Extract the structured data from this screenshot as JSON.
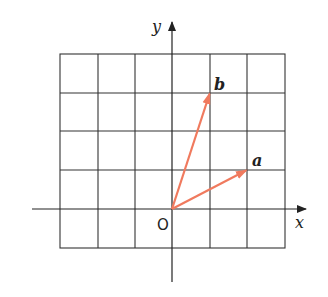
{
  "diagram": {
    "type": "vector-grid",
    "grid": {
      "x_min": -3,
      "x_max": 3,
      "y_min": -1,
      "y_max": 4,
      "cell": 1
    },
    "axes": {
      "x_label": "x",
      "y_label": "y",
      "origin_label": "O"
    },
    "vectors": [
      {
        "name": "a",
        "from": [
          0,
          0
        ],
        "to": [
          2,
          1
        ],
        "color": "#f07a5e"
      },
      {
        "name": "b",
        "from": [
          0,
          0
        ],
        "to": [
          1,
          3
        ],
        "color": "#f07a5e"
      }
    ],
    "colors": {
      "grid": "#333333",
      "axis": "#222222",
      "vector": "#f07a5e"
    }
  }
}
